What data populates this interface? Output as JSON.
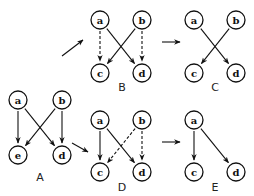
{
  "diagram": {
    "panels": [
      {
        "id": "A",
        "label": "A",
        "nodes": [
          {
            "id": "a",
            "label": "a",
            "x": 18,
            "y": 100
          },
          {
            "id": "b",
            "label": "b",
            "x": 62,
            "y": 100
          },
          {
            "id": "c",
            "label": "e",
            "x": 18,
            "y": 155
          },
          {
            "id": "d",
            "label": "d",
            "x": 62,
            "y": 155
          }
        ],
        "label_pos": [
          40,
          181
        ],
        "edges": [
          {
            "from": "a",
            "to": "c",
            "style": "solid"
          },
          {
            "from": "a",
            "to": "d",
            "style": "solid"
          },
          {
            "from": "b",
            "to": "c",
            "style": "solid"
          },
          {
            "from": "b",
            "to": "d",
            "style": "solid"
          }
        ]
      },
      {
        "id": "B",
        "label": "B",
        "nodes": [
          {
            "id": "a",
            "label": "a",
            "x": 100,
            "y": 20
          },
          {
            "id": "b",
            "label": "b",
            "x": 142,
            "y": 20
          },
          {
            "id": "c",
            "label": "c",
            "x": 100,
            "y": 73
          },
          {
            "id": "d",
            "label": "d",
            "x": 142,
            "y": 73
          }
        ],
        "label_pos": [
          122,
          91
        ],
        "edges": [
          {
            "from": "a",
            "to": "c",
            "style": "dashed"
          },
          {
            "from": "a",
            "to": "d",
            "style": "solid"
          },
          {
            "from": "b",
            "to": "c",
            "style": "solid"
          },
          {
            "from": "b",
            "to": "d",
            "style": "dashed"
          }
        ]
      },
      {
        "id": "C",
        "label": "C",
        "nodes": [
          {
            "id": "a",
            "label": "a",
            "x": 194,
            "y": 20
          },
          {
            "id": "b",
            "label": "b",
            "x": 236,
            "y": 20
          },
          {
            "id": "c",
            "label": "c",
            "x": 194,
            "y": 73
          },
          {
            "id": "d",
            "label": "d",
            "x": 236,
            "y": 73
          }
        ],
        "label_pos": [
          215,
          91
        ],
        "edges": [
          {
            "from": "a",
            "to": "d",
            "style": "solid"
          },
          {
            "from": "b",
            "to": "c",
            "style": "solid"
          }
        ]
      },
      {
        "id": "D",
        "label": "D",
        "nodes": [
          {
            "id": "a",
            "label": "a",
            "x": 100,
            "y": 120
          },
          {
            "id": "b",
            "label": "b",
            "x": 142,
            "y": 120
          },
          {
            "id": "c",
            "label": "c",
            "x": 100,
            "y": 172
          },
          {
            "id": "d",
            "label": "d",
            "x": 142,
            "y": 172
          }
        ],
        "label_pos": [
          122,
          191
        ],
        "edges": [
          {
            "from": "a",
            "to": "c",
            "style": "solid"
          },
          {
            "from": "a",
            "to": "d",
            "style": "solid"
          },
          {
            "from": "b",
            "to": "c",
            "style": "dashed"
          },
          {
            "from": "b",
            "to": "d",
            "style": "dashed"
          }
        ]
      },
      {
        "id": "E",
        "label": "E",
        "nodes": [
          {
            "id": "a",
            "label": "a",
            "x": 194,
            "y": 120
          },
          {
            "id": "c",
            "label": "c",
            "x": 194,
            "y": 172
          },
          {
            "id": "d",
            "label": "d",
            "x": 236,
            "y": 172
          }
        ],
        "label_pos": [
          215,
          191
        ],
        "edges": [
          {
            "from": "a",
            "to": "c",
            "style": "solid"
          },
          {
            "from": "a",
            "to": "d",
            "style": "solid"
          }
        ]
      }
    ],
    "transitions": [
      {
        "from": "A",
        "to": "B",
        "x1": 62,
        "y1": 56,
        "x2": 83,
        "y2": 40
      },
      {
        "from": "A",
        "to": "D",
        "x1": 72,
        "y1": 143,
        "x2": 88,
        "y2": 152
      },
      {
        "from": "B",
        "to": "C",
        "x1": 162,
        "y1": 42,
        "x2": 180,
        "y2": 42
      },
      {
        "from": "D",
        "to": "E",
        "x1": 162,
        "y1": 142,
        "x2": 180,
        "y2": 142
      }
    ],
    "node_radius": 9
  }
}
